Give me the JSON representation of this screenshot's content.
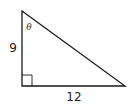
{
  "diagram": {
    "type": "right-triangle",
    "labels": {
      "left_side": "9",
      "bottom_side": "12",
      "angle": "θ"
    },
    "right_angle_marker": "bottom-left",
    "angle_marker_vertex": "top"
  }
}
